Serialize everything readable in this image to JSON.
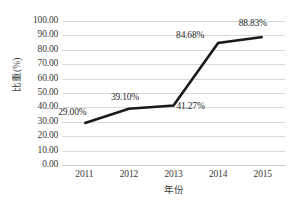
{
  "chart_data": {
    "type": "line",
    "title": "",
    "subtitle": "",
    "xlabel": "年份",
    "ylabel": "比重(%)",
    "categories": [
      "2011",
      "2012",
      "2013",
      "2014",
      "2015"
    ],
    "values": [
      29.0,
      39.1,
      41.27,
      84.68,
      88.83
    ],
    "series": [
      {
        "name": "比重",
        "values": [
          29.0,
          39.1,
          41.27,
          84.68,
          88.83
        ],
        "color": "#1a1a1a"
      }
    ],
    "data_labels": [
      "29.00%",
      "39.10%",
      "41.27%",
      "84.68%",
      "88.83%"
    ],
    "ylim": [
      0,
      100
    ],
    "ytick_step": 10,
    "ytick_labels": [
      "100.00",
      "90.00",
      "80.00",
      "70.00",
      "60.00",
      "50.00",
      "40.00",
      "30.00",
      "20.00",
      "10.00",
      "0.00"
    ],
    "ytick_values": [
      100,
      90,
      80,
      70,
      60,
      50,
      40,
      30,
      20,
      10,
      0
    ],
    "xtick_labels": [
      "2011",
      "2012",
      "2013",
      "2014",
      "2015"
    ],
    "grid": "horizontal",
    "grid_color": "#d9d9d9",
    "legend": "none",
    "legend_position": "none",
    "background_color": "#ffffff",
    "line_color": "#1a1a1a",
    "line_width": 2.6,
    "markers": false,
    "annotations": []
  }
}
